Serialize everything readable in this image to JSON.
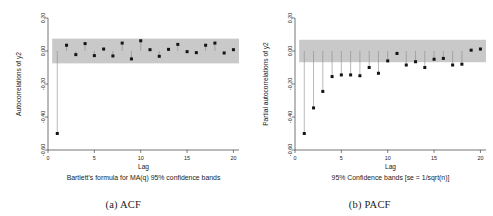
{
  "figure": {
    "background": "#ffffff",
    "band_color": "#c9c9c9",
    "marker_color": "#141414",
    "stem_color": "#8a8a8a",
    "axis_color": "#1a1a1a"
  },
  "panels": [
    {
      "caption": "(a) ACF",
      "caption_letter": "(a)",
      "caption_text": "ACF"
    },
    {
      "caption": "(b) PACF",
      "caption_letter": "(b)",
      "caption_text": "PACF"
    }
  ],
  "chart_data": [
    {
      "type": "bar",
      "title": "",
      "subtitle": "Bartlett's formula for MA(q) 95% confidence bands",
      "xlabel": "Lag",
      "ylabel": "Autocorrelations of y2",
      "xlim": [
        0,
        20.6
      ],
      "ylim": [
        -0.6,
        0.2
      ],
      "xticks": [
        0,
        5,
        10,
        15,
        20
      ],
      "xticklabels": [
        "0",
        "5",
        "10",
        "15",
        "20"
      ],
      "yticks": [
        0.2,
        0.0,
        -0.2,
        -0.4,
        -0.6
      ],
      "yticklabels": [
        "0.20",
        "0.00",
        "-0.20",
        "-0.40",
        "-0.60"
      ],
      "grid": false,
      "legend": "none",
      "confidence_band": {
        "upper": 0.075,
        "lower": -0.075,
        "label": "95% confidence band",
        "color": "#c9c9c9"
      },
      "categories": [
        1,
        2,
        3,
        4,
        5,
        6,
        7,
        8,
        9,
        10,
        11,
        12,
        13,
        14,
        15,
        16,
        17,
        18,
        19,
        20
      ],
      "values": [
        -0.5,
        0.035,
        -0.022,
        0.045,
        -0.028,
        0.012,
        -0.03,
        0.048,
        -0.048,
        0.062,
        0.008,
        -0.032,
        0.01,
        0.04,
        -0.004,
        -0.01,
        0.035,
        0.048,
        -0.012,
        0.008
      ],
      "series": [
        {
          "name": "Autocorrelations of y2",
          "values": [
            -0.5,
            0.035,
            -0.022,
            0.045,
            -0.028,
            0.012,
            -0.03,
            0.048,
            -0.048,
            0.062,
            0.008,
            -0.032,
            0.01,
            0.04,
            -0.004,
            -0.01,
            0.035,
            0.048,
            -0.012,
            0.008
          ]
        }
      ]
    },
    {
      "type": "bar",
      "title": "",
      "subtitle": "95% Confidence bands [se = 1/sqrt(n)]",
      "xlabel": "Lag",
      "ylabel": "Partial autocorrelations of y2",
      "xlim": [
        0,
        20.6
      ],
      "ylim": [
        -0.6,
        0.2
      ],
      "xticks": [
        0,
        5,
        10,
        15,
        20
      ],
      "xticklabels": [
        "0",
        "5",
        "10",
        "15",
        "20"
      ],
      "yticks": [
        0.2,
        0.0,
        -0.2,
        -0.4,
        -0.6
      ],
      "yticklabels": [
        "0.20",
        "0.00",
        "-0.20",
        "-0.40",
        "-0.60"
      ],
      "grid": false,
      "legend": "none",
      "confidence_band": {
        "upper": 0.068,
        "lower": -0.068,
        "label": "95% Confidence bands [se = 1/sqrt(n)]",
        "color": "#c9c9c9"
      },
      "categories": [
        1,
        2,
        3,
        4,
        5,
        6,
        7,
        8,
        9,
        10,
        11,
        12,
        13,
        14,
        15,
        16,
        17,
        18,
        19,
        20
      ],
      "values": [
        -0.5,
        -0.345,
        -0.245,
        -0.155,
        -0.145,
        -0.145,
        -0.15,
        -0.1,
        -0.135,
        -0.06,
        -0.015,
        -0.085,
        -0.065,
        -0.1,
        -0.05,
        -0.045,
        -0.085,
        -0.08,
        0.005,
        0.012
      ],
      "series": [
        {
          "name": "Partial autocorrelations of y2",
          "values": [
            -0.5,
            -0.345,
            -0.245,
            -0.155,
            -0.145,
            -0.145,
            -0.15,
            -0.1,
            -0.135,
            -0.06,
            -0.015,
            -0.085,
            -0.065,
            -0.1,
            -0.05,
            -0.045,
            -0.085,
            -0.08,
            0.005,
            0.012
          ]
        }
      ]
    }
  ]
}
